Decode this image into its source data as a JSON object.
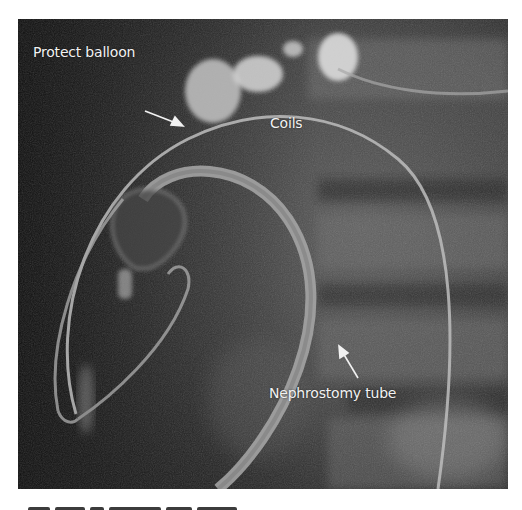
{
  "figure": {
    "type": "fluoroscopy-radiograph",
    "annotations": [
      {
        "id": "protect-balloon",
        "text": "Protect balloon",
        "x": 30,
        "y": 52
      },
      {
        "id": "coils",
        "text": "Coils",
        "x": 252,
        "y": 96
      },
      {
        "id": "nephrostomy-tube",
        "text": "Nephrostomy tube",
        "x": 251,
        "y": 373
      }
    ],
    "colors": {
      "background_dark": "#1c1c1c",
      "background_mid": "#4a4a4a",
      "annotation_text": "#f2f2f2",
      "catheter": "#bdbdbd"
    }
  },
  "caption": {
    "visible": "truncated"
  }
}
